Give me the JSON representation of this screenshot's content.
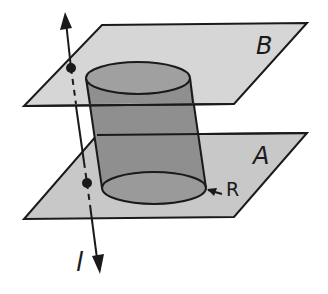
{
  "diagram": {
    "type": "geometry-3d",
    "labels": {
      "plane_b": "B",
      "plane_a": "A",
      "region": "R",
      "line": "l"
    },
    "colors": {
      "plane_fill": "#c8c8c8",
      "cylinder_fill": "#8f8f8f",
      "ellipse_fill": "#9a9a9a",
      "stroke": "#1a1a1a",
      "background": "#ffffff"
    },
    "elements": [
      {
        "name": "plane B",
        "kind": "parallelogram"
      },
      {
        "name": "plane A",
        "kind": "parallelogram"
      },
      {
        "name": "cylinder",
        "kind": "cylinder between planes"
      },
      {
        "name": "region R",
        "kind": "circular base on plane A"
      },
      {
        "name": "line l",
        "kind": "line with arrows intersecting both planes"
      }
    ]
  }
}
